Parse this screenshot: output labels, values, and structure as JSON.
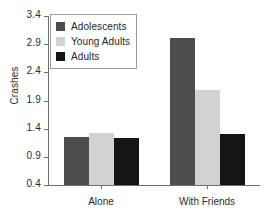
{
  "chart_data": {
    "type": "bar",
    "title": "",
    "xlabel": "",
    "ylabel": "Crashes",
    "categories": [
      "Alone",
      "With Friends"
    ],
    "series": [
      {
        "name": "Adolescents",
        "color": "#4d4d4d",
        "values": [
          1.25,
          3.01
        ]
      },
      {
        "name": "Young Adults",
        "color": "#d2d2d2",
        "values": [
          1.32,
          2.09
        ]
      },
      {
        "name": "Adults",
        "color": "#141414",
        "values": [
          1.23,
          1.31
        ]
      }
    ],
    "ylim": [
      0.4,
      3.4
    ],
    "yticks": [
      "0.4",
      "0.9",
      "1.4",
      "1.9",
      "2.4",
      "2.9",
      "3.4"
    ],
    "ytick_values": [
      0.4,
      0.9,
      1.4,
      1.9,
      2.4,
      2.9,
      3.4
    ],
    "grid": false,
    "legend_position": "upper-left-inside"
  },
  "legend": {
    "entries": [
      {
        "label": "Adolescents",
        "color": "#4d4d4d"
      },
      {
        "label": "Young Adults",
        "color": "#d2d2d2"
      },
      {
        "label": "Adults",
        "color": "#141414"
      }
    ]
  },
  "axes": {
    "y_title": "Crashes",
    "y_tick_labels": [
      "3.4",
      "2.9",
      "2.4",
      "1.9",
      "1.4",
      "0.9",
      "0.4"
    ],
    "x_category_labels": [
      "Alone",
      "With Friends"
    ]
  }
}
